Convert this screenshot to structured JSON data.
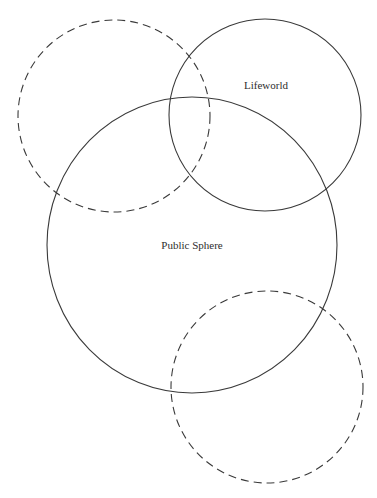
{
  "diagram": {
    "type": "venn-overlapping-circles",
    "colors": {
      "background": "#ffffff",
      "stroke": "#3a3a3a",
      "text": "#2e2e2e"
    },
    "shapes": [
      {
        "id": "unlabeled-top-left",
        "style": "dashed",
        "label": "",
        "cx": 114,
        "cy": 116,
        "rx": 96,
        "ry": 96
      },
      {
        "id": "lifeworld",
        "style": "solid",
        "label": "Lifeworld",
        "cx": 265,
        "cy": 115,
        "rx": 96,
        "ry": 96,
        "label_x": 266,
        "label_y": 89
      },
      {
        "id": "public-sphere",
        "style": "solid",
        "label": "Public Sphere",
        "cx": 192,
        "cy": 245,
        "rx": 145,
        "ry": 148,
        "label_x": 192,
        "label_y": 249
      },
      {
        "id": "unlabeled-bottom-right",
        "style": "dashed",
        "label": "",
        "cx": 267,
        "cy": 387,
        "rx": 96,
        "ry": 96
      }
    ],
    "labels": {
      "lifeworld": "Lifeworld",
      "public_sphere": "Public Sphere"
    }
  }
}
